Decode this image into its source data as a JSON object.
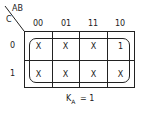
{
  "map": {
    "corner_top": "AB",
    "corner_left": "C",
    "col_headers": [
      "00",
      "01",
      "11",
      "10"
    ],
    "row_headers": [
      "0",
      "1"
    ],
    "cells": [
      [
        "X",
        "X",
        "X",
        "1"
      ],
      [
        "X",
        "X",
        "X",
        "X"
      ]
    ]
  },
  "result": {
    "var": "K",
    "sub": "A",
    "eq": "= 1"
  }
}
